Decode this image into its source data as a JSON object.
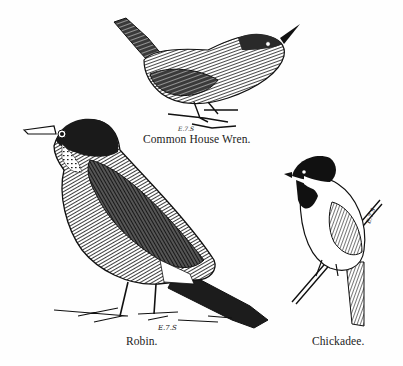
{
  "plate": {
    "style": "black-and-white engraving",
    "background": "#fefefe",
    "ink": "#1a1a1a"
  },
  "birds": [
    {
      "name": "house-wren",
      "caption": "Common House Wren.",
      "engraver_mark": "E.7.S"
    },
    {
      "name": "robin",
      "caption": "Robin.",
      "engraver_mark": "E.7.S"
    },
    {
      "name": "chickadee",
      "caption": "Chickadee.",
      "engraver_mark": "E.7.S"
    }
  ]
}
